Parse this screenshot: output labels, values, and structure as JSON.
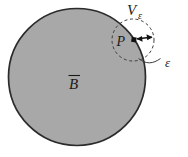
{
  "figure": {
    "type": "math-diagram",
    "caption_text": "",
    "background_color": "#ffffff",
    "body_fill_color": "#a8a8a8",
    "stroke_color": "#2b2b2b",
    "labels": {
      "body": "B",
      "body_accent": "overline",
      "body_display": "B̄",
      "neighborhood": "V",
      "neighborhood_subscript": "ε",
      "neighborhood_display": "Vε",
      "point": "P",
      "radius": "ε"
    },
    "shapes": {
      "body_circle": {
        "name": "closed-body-B",
        "cx": 77,
        "cy": 77,
        "r": 69,
        "fill": "#a8a8a8",
        "stroke": "#2b2b2b",
        "stroke_width": 1.6,
        "dashed": false
      },
      "neighborhood_circle": {
        "name": "epsilon-neighborhood",
        "cx": 133,
        "cy": 40,
        "r": 21,
        "fill": "none",
        "stroke": "#3a3a3a",
        "stroke_width": 1,
        "dashed": true,
        "dash_pattern": "3 2.5"
      },
      "point_marker": {
        "name": "point-P",
        "cx": 134,
        "cy": 40,
        "size": 4.6,
        "fill": "#111111",
        "shape": "square"
      },
      "radius_arrow": {
        "name": "epsilon-radius-arrow",
        "x1": 136,
        "y1": 39,
        "x2": 153,
        "y2": 37,
        "double_headed": true,
        "stroke": "#111111",
        "stroke_width": 1.3
      },
      "leader_line": {
        "name": "epsilon-leader",
        "path": "M 140 57 C 150 62, 155 62, 160 58",
        "stroke": "#3a3a3a",
        "stroke_width": 1
      }
    },
    "label_positions": {
      "neighborhood": {
        "x": 128,
        "y": 14
      },
      "neighborhood_sub": {
        "x": 139,
        "y": 17
      },
      "point": {
        "x": 118,
        "y": 45
      },
      "radius": {
        "x": 168,
        "y": 64
      },
      "body": {
        "x": 70,
        "y": 88
      }
    }
  }
}
